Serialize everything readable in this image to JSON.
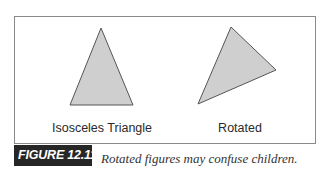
{
  "figure": {
    "tag": "FIGURE 12.11",
    "caption": "Rotated figures may confuse children."
  },
  "shapes": [
    {
      "name": "isosceles-triangle",
      "label": "Isosceles Triangle",
      "points": "101,28 70,105 133,105",
      "fill": "#cfcfcf",
      "stroke": "#555555"
    },
    {
      "name": "rotated-triangle",
      "label": "Rotated",
      "points": "231,27 276,70 198,104",
      "fill": "#cfcfcf",
      "stroke": "#555555"
    }
  ],
  "colors": {
    "frame_border": "#8a8a8a",
    "tag_background": "#262626",
    "tag_text": "#ffffff"
  }
}
